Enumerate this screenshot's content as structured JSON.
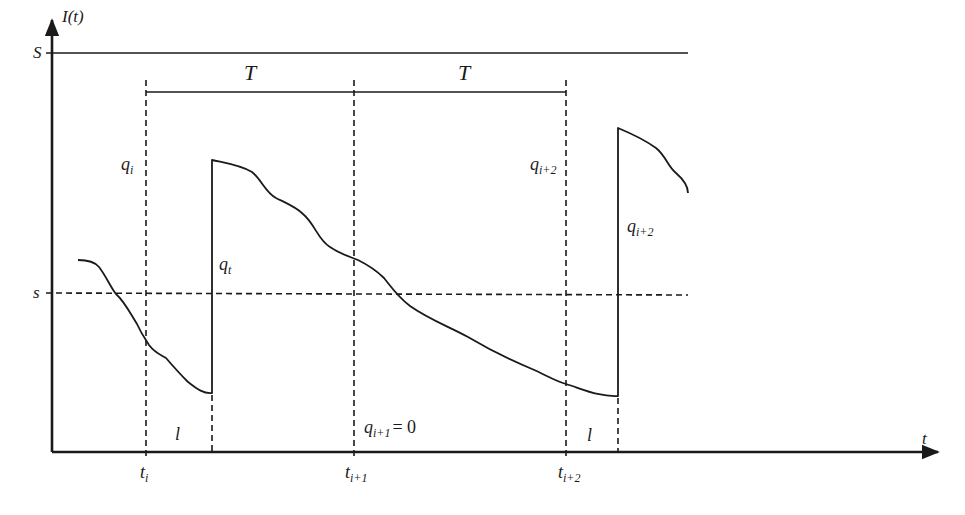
{
  "diagram": {
    "axes": {
      "y_label": "I(t)",
      "x_label": "t"
    },
    "levels": {
      "upper": "S",
      "reorder": "s"
    },
    "periods": {
      "first": "T",
      "second": "T"
    },
    "time_marks": [
      "t",
      "t",
      "t"
    ],
    "time_subscripts": [
      "i",
      "i+1",
      "i+2"
    ],
    "lead_times": [
      "l",
      "l"
    ],
    "quantities": {
      "q_i": {
        "base": "q",
        "sub": "i"
      },
      "q_t": {
        "base": "q",
        "sub": "t"
      },
      "q_i2_left": {
        "base": "q",
        "sub": "i+2"
      },
      "q_i2_right": {
        "base": "q",
        "sub": "i+2"
      },
      "q_i1_zero": {
        "base": "q",
        "sub": "i+1",
        "eq": "= 0"
      }
    },
    "colors": {
      "ink": "#1a1a1a",
      "background": "#ffffff"
    }
  }
}
